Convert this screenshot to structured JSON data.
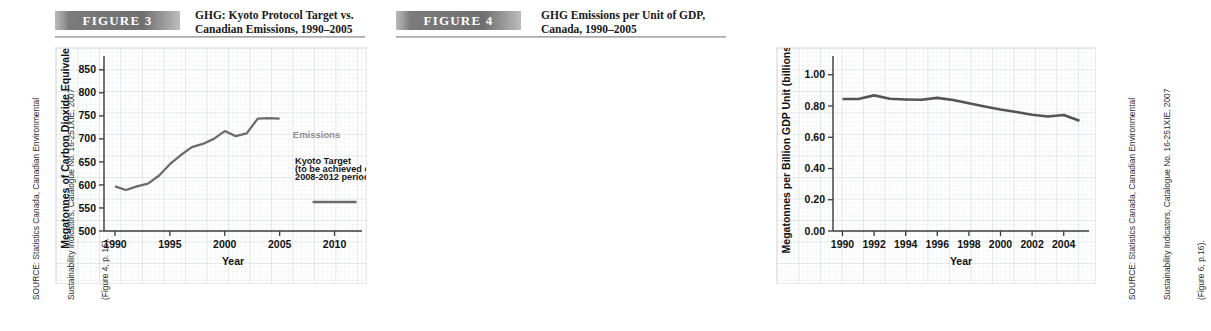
{
  "figures": [
    {
      "banner_label": "FIGURE 3",
      "title_line1": "GHG: Kyoto Protocol Target vs.",
      "title_line2": "Canadian Emissions, 1990–2005",
      "source_line1": "SOURCE: Statistics Canada, Canadian Environmental",
      "source_line2": "Sustainability Indicators, Catalogue No. 16-251XIE, 2007",
      "source_line3": "(Figure 4, p. 15)."
    },
    {
      "banner_label": "FIGURE  4",
      "title_line1": "GHG Emissions per Unit of GDP,",
      "title_line2": "Canada, 1990–2005",
      "source_line1": "SOURCE: Statistics Canada, Canadian Environmental",
      "source_line2": "Sustainability Indicators, Catalogue No. 16-251XIE, 2007",
      "source_line3": "(Figure 6, p.16)."
    }
  ],
  "chart_data": [
    {
      "type": "line",
      "title": "GHG: Kyoto Protocol Target vs. Canadian Emissions, 1990–2005",
      "xlabel": "Year",
      "ylabel": "Megatonnes of Carbon Dioxide Equivalent",
      "xlim": [
        1989,
        2012.5
      ],
      "ylim": [
        500,
        880
      ],
      "xticks": [
        1990,
        1995,
        2000,
        2005,
        2010
      ],
      "xticklabels": [
        "1990",
        "1995",
        "2000",
        "2005",
        "2010"
      ],
      "yticks": [
        500,
        550,
        600,
        650,
        700,
        750,
        800,
        850
      ],
      "yticklabels": [
        "500",
        "550",
        "600",
        "650",
        "700",
        "750",
        "800",
        "850"
      ],
      "grid": true,
      "legend": "none",
      "series": [
        {
          "name": "Emissions",
          "color": "#6b6b6b",
          "x": [
            1990,
            1991,
            1992,
            1993,
            1994,
            1995,
            1996,
            1997,
            1998,
            1999,
            2000,
            2001,
            2002,
            2003,
            2004,
            2005
          ],
          "values": [
            597,
            589,
            597,
            603,
            620,
            645,
            665,
            682,
            689,
            700,
            717,
            706,
            712,
            744,
            745,
            744
          ]
        },
        {
          "name": "Kyoto Target (to be achieved during 2008-2012 period)",
          "color": "#6b6b6b",
          "x": [
            2008,
            2012
          ],
          "values": [
            563,
            563
          ]
        }
      ],
      "annotations": [
        {
          "text": "Emissions",
          "x": 2006.2,
          "y": 703,
          "color": "#8e8e8e"
        },
        {
          "text": "Kyoto Target",
          "x": 2006.4,
          "y": 645,
          "color": "#161616"
        },
        {
          "text": "(to be achieved during",
          "x": 2006.4,
          "y": 628,
          "color": "#161616"
        },
        {
          "text": "2008-2012 period)",
          "x": 2006.4,
          "y": 611,
          "color": "#161616"
        }
      ]
    },
    {
      "type": "line",
      "title": "GHG Emissions per Unit of GDP, Canada, 1990–2005",
      "xlabel": "Year",
      "ylabel": "Megatonnes per Billion GDP Unit (billions $)",
      "xlim": [
        1989.4,
        2005.6
      ],
      "ylim": [
        0.0,
        1.12
      ],
      "xticks": [
        1990,
        1992,
        1994,
        1996,
        1998,
        2000,
        2002,
        2004
      ],
      "xticklabels": [
        "1990",
        "1992",
        "1994",
        "1996",
        "1998",
        "2000",
        "2002",
        "2004"
      ],
      "yticks": [
        0.0,
        0.2,
        0.4,
        0.6,
        0.8,
        1.0
      ],
      "yticklabels": [
        "0.00",
        "0.20",
        "0.40",
        "0.60",
        "0.80",
        "1.00"
      ],
      "grid": true,
      "legend": "none",
      "series": [
        {
          "name": "GHG per unit of GDP",
          "color": "#545454",
          "x": [
            1990,
            1991,
            1992,
            1993,
            1994,
            1995,
            1996,
            1997,
            1998,
            1999,
            2000,
            2001,
            2002,
            2003,
            2004,
            2005
          ],
          "values": [
            0.845,
            0.845,
            0.868,
            0.846,
            0.842,
            0.84,
            0.852,
            0.838,
            0.818,
            0.797,
            0.778,
            0.762,
            0.744,
            0.733,
            0.742,
            0.705
          ]
        }
      ],
      "annotations": []
    }
  ]
}
